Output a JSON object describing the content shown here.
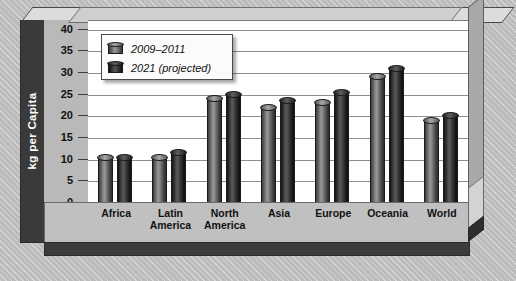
{
  "chart_data": {
    "type": "bar",
    "title": "",
    "xlabel": "",
    "ylabel": "kg per Capita",
    "ylim": [
      0,
      42
    ],
    "yticks": [
      0,
      5,
      10,
      15,
      20,
      25,
      30,
      35,
      40
    ],
    "grid": true,
    "legend_position": "top-left",
    "categories": [
      "Africa",
      "Latin\nAmerica",
      "North\nAmerica",
      "Asia",
      "Europe",
      "Oceania",
      "World"
    ],
    "series": [
      {
        "name": "2009–2011",
        "values": [
          10.5,
          10.5,
          24.0,
          22.0,
          23.0,
          29.0,
          19.0
        ]
      },
      {
        "name": "2021 (projected)",
        "values": [
          10.3,
          11.5,
          25.0,
          23.5,
          25.5,
          31.0,
          20.0
        ]
      }
    ],
    "colors": {
      "series1": "#8a8a8a",
      "series2": "#2a2a2a",
      "plot_background": "#ffffff",
      "gridline": "#8e8e8e",
      "axis_band": "#b9b9b9",
      "left_wall": "#3a3a3a",
      "floor": "#c0c0c0",
      "page_background": "#c3c3c3"
    }
  },
  "legend": {
    "items": [
      {
        "label": "2009–2011"
      },
      {
        "label": "2021 (projected)"
      }
    ]
  },
  "axis": {
    "y_title": "kg per Capita",
    "tick_labels": [
      "40",
      "35",
      "30",
      "25",
      "20",
      "15",
      "10",
      "5",
      "0"
    ]
  },
  "categories": [
    {
      "line1": "Africa",
      "line2": ""
    },
    {
      "line1": "Latin",
      "line2": "America"
    },
    {
      "line1": "North",
      "line2": "America"
    },
    {
      "line1": "Asia",
      "line2": ""
    },
    {
      "line1": "Europe",
      "line2": ""
    },
    {
      "line1": "Oceania",
      "line2": ""
    },
    {
      "line1": "World",
      "line2": ""
    }
  ]
}
